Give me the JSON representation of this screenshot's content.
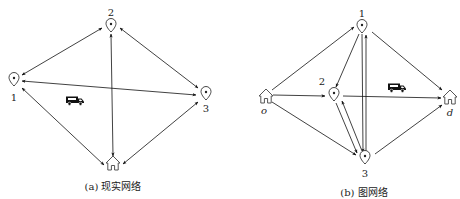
{
  "panel_a": {
    "caption": "(a) 现实网络",
    "nodes": [
      {
        "id": "1",
        "label": "1",
        "type": "location-pin"
      },
      {
        "id": "2",
        "label": "2",
        "type": "location-pin"
      },
      {
        "id": "3",
        "label": "3",
        "type": "location-pin"
      },
      {
        "id": "depot",
        "label": "",
        "type": "home"
      }
    ],
    "edges": [
      {
        "from": "1",
        "to": "2",
        "direction": "both"
      },
      {
        "from": "1",
        "to": "3",
        "direction": "both"
      },
      {
        "from": "2",
        "to": "3",
        "direction": "both"
      },
      {
        "from": "2",
        "to": "depot",
        "direction": "both"
      },
      {
        "from": "1",
        "to": "depot",
        "direction": "both"
      },
      {
        "from": "3",
        "to": "depot",
        "direction": "both"
      }
    ],
    "vehicle": "truck-icon"
  },
  "panel_b": {
    "caption": "(b) 图网络",
    "nodes": [
      {
        "id": "o",
        "label": "o",
        "type": "home"
      },
      {
        "id": "1",
        "label": "1",
        "type": "location-pin"
      },
      {
        "id": "2",
        "label": "2",
        "type": "location-pin"
      },
      {
        "id": "3",
        "label": "3",
        "type": "location-pin"
      },
      {
        "id": "d",
        "label": "d",
        "type": "home"
      }
    ],
    "edges": [
      {
        "from": "o",
        "to": "1"
      },
      {
        "from": "o",
        "to": "2"
      },
      {
        "from": "o",
        "to": "3"
      },
      {
        "from": "1",
        "to": "2"
      },
      {
        "from": "1",
        "to": "3"
      },
      {
        "from": "3",
        "to": "1"
      },
      {
        "from": "2",
        "to": "3"
      },
      {
        "from": "3",
        "to": "2"
      },
      {
        "from": "1",
        "to": "d"
      },
      {
        "from": "2",
        "to": "d"
      },
      {
        "from": "3",
        "to": "d"
      }
    ],
    "vehicle": "truck-icon"
  }
}
